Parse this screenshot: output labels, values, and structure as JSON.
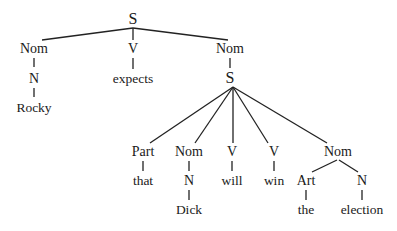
{
  "diagram": {
    "type": "syntax-tree",
    "line_color": "#222222",
    "nodes": [
      {
        "id": "s_root",
        "label": "S",
        "x": 133,
        "y": 19,
        "kind": "big"
      },
      {
        "id": "nom_subj",
        "label": "Nom",
        "x": 34,
        "y": 49,
        "kind": "cat"
      },
      {
        "id": "n_subj",
        "label": "N",
        "x": 34,
        "y": 79,
        "kind": "cat"
      },
      {
        "id": "w_rocky",
        "label": "Rocky",
        "x": 34,
        "y": 108,
        "kind": "word"
      },
      {
        "id": "v_main",
        "label": "V",
        "x": 133,
        "y": 49,
        "kind": "cat"
      },
      {
        "id": "w_expects",
        "label": "expects",
        "x": 133,
        "y": 79,
        "kind": "word"
      },
      {
        "id": "nom_obj",
        "label": "Nom",
        "x": 230,
        "y": 49,
        "kind": "cat"
      },
      {
        "id": "s_emb",
        "label": "S",
        "x": 230,
        "y": 78,
        "kind": "big"
      },
      {
        "id": "part",
        "label": "Part",
        "x": 143,
        "y": 152,
        "kind": "cat"
      },
      {
        "id": "w_that",
        "label": "that",
        "x": 143,
        "y": 181,
        "kind": "word"
      },
      {
        "id": "nom_emb",
        "label": "Nom",
        "x": 189,
        "y": 152,
        "kind": "cat"
      },
      {
        "id": "n_emb",
        "label": "N",
        "x": 189,
        "y": 181,
        "kind": "cat"
      },
      {
        "id": "w_dick",
        "label": "Dick",
        "x": 189,
        "y": 210,
        "kind": "word"
      },
      {
        "id": "v_will",
        "label": "V",
        "x": 232,
        "y": 152,
        "kind": "cat"
      },
      {
        "id": "w_will",
        "label": "will",
        "x": 232,
        "y": 181,
        "kind": "word"
      },
      {
        "id": "v_win",
        "label": "V",
        "x": 274,
        "y": 152,
        "kind": "cat"
      },
      {
        "id": "w_win",
        "label": "win",
        "x": 274,
        "y": 181,
        "kind": "word"
      },
      {
        "id": "nom_elec",
        "label": "Nom",
        "x": 338,
        "y": 152,
        "kind": "cat"
      },
      {
        "id": "art",
        "label": "Art",
        "x": 306,
        "y": 181,
        "kind": "cat"
      },
      {
        "id": "w_the",
        "label": "the",
        "x": 306,
        "y": 210,
        "kind": "word"
      },
      {
        "id": "n_elec",
        "label": "N",
        "x": 362,
        "y": 181,
        "kind": "cat"
      },
      {
        "id": "w_election",
        "label": "election",
        "x": 362,
        "y": 210,
        "kind": "word"
      }
    ],
    "edges": [
      {
        "from": "s_root",
        "to": "nom_subj",
        "x1": 133,
        "y1": 28,
        "x2": 42,
        "y2": 40
      },
      {
        "from": "s_root",
        "to": "v_main",
        "x1": 133,
        "y1": 28,
        "x2": 133,
        "y2": 40
      },
      {
        "from": "s_root",
        "to": "nom_obj",
        "x1": 133,
        "y1": 28,
        "x2": 228,
        "y2": 40
      },
      {
        "from": "nom_subj",
        "to": "n_subj",
        "x1": 34,
        "y1": 58,
        "x2": 34,
        "y2": 67
      },
      {
        "from": "n_subj",
        "to": "w_rocky",
        "x1": 34,
        "y1": 88,
        "x2": 34,
        "y2": 97
      },
      {
        "from": "v_main",
        "to": "w_expects",
        "x1": 133,
        "y1": 58,
        "x2": 133,
        "y2": 69
      },
      {
        "from": "nom_obj",
        "to": "s_emb",
        "x1": 230,
        "y1": 58,
        "x2": 230,
        "y2": 68
      },
      {
        "from": "s_emb",
        "to": "part",
        "x1": 233,
        "y1": 87,
        "x2": 150,
        "y2": 143
      },
      {
        "from": "s_emb",
        "to": "nom_emb",
        "x1": 233,
        "y1": 87,
        "x2": 195,
        "y2": 143
      },
      {
        "from": "s_emb",
        "to": "v_will",
        "x1": 233,
        "y1": 87,
        "x2": 233,
        "y2": 143
      },
      {
        "from": "s_emb",
        "to": "v_win",
        "x1": 233,
        "y1": 87,
        "x2": 268,
        "y2": 143
      },
      {
        "from": "s_emb",
        "to": "nom_elec",
        "x1": 233,
        "y1": 87,
        "x2": 327,
        "y2": 143
      },
      {
        "from": "part",
        "to": "w_that",
        "x1": 143,
        "y1": 161,
        "x2": 143,
        "y2": 171
      },
      {
        "from": "nom_emb",
        "to": "n_emb",
        "x1": 189,
        "y1": 161,
        "x2": 189,
        "y2": 171
      },
      {
        "from": "n_emb",
        "to": "w_dick",
        "x1": 189,
        "y1": 190,
        "x2": 189,
        "y2": 200
      },
      {
        "from": "v_will",
        "to": "w_will",
        "x1": 232,
        "y1": 161,
        "x2": 232,
        "y2": 171
      },
      {
        "from": "v_win",
        "to": "w_win",
        "x1": 274,
        "y1": 161,
        "x2": 274,
        "y2": 171
      },
      {
        "from": "nom_elec",
        "to": "art",
        "x1": 337,
        "y1": 160,
        "x2": 312,
        "y2": 172
      },
      {
        "from": "nom_elec",
        "to": "n_elec",
        "x1": 339,
        "y1": 160,
        "x2": 358,
        "y2": 172
      },
      {
        "from": "art",
        "to": "w_the",
        "x1": 306,
        "y1": 190,
        "x2": 306,
        "y2": 200
      },
      {
        "from": "n_elec",
        "to": "w_election",
        "x1": 362,
        "y1": 190,
        "x2": 362,
        "y2": 200
      }
    ]
  }
}
